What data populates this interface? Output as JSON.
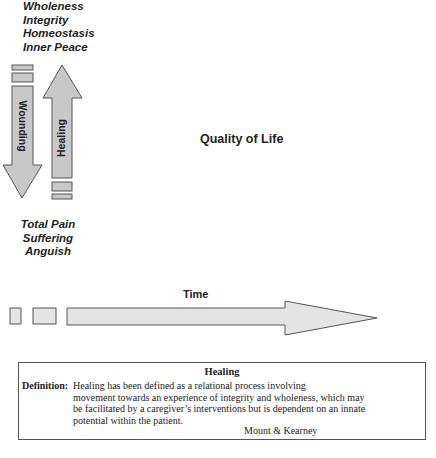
{
  "top_states": [
    "Wholeness",
    "Integrity",
    "Homeostasis",
    "Inner Peace"
  ],
  "bottom_states": [
    "Total Pain",
    "Suffering",
    "Anguish"
  ],
  "arrows": {
    "down_label": "Wounding",
    "up_label": "Healing",
    "time_label": "Time"
  },
  "center_label": "Quality of Life",
  "definition_box": {
    "title": "Healing",
    "label": "Definition:",
    "lines": [
      "Healing has been defined as a relational process involving",
      "movement towards an experience of integrity and wholeness, which may",
      "be facilitated by a caregiver’s interventions but is dependent on an innate",
      "potential within the patient."
    ],
    "attribution": "Mount & Kearney"
  },
  "colors": {
    "arrow_fill": "#c8c8c8",
    "arrow_fill_light": "#e4e4e4",
    "stroke": "#555555"
  }
}
